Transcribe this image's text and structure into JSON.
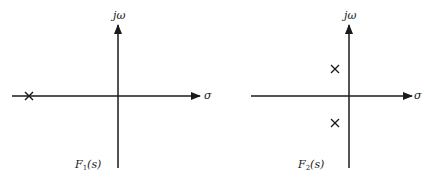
{
  "diagram": {
    "type": "s-plane pole plots",
    "panels": [
      {
        "name": "F1",
        "caption": "F",
        "caption_sub": "1",
        "caption_arg": "(s)",
        "vertical_axis_label": "jω",
        "horizontal_axis_label": "σ",
        "poles": [
          {
            "description": "single real pole on negative real axis"
          }
        ]
      },
      {
        "name": "F2",
        "caption": "F",
        "caption_sub": "2",
        "caption_arg": "(s)",
        "vertical_axis_label": "jω",
        "horizontal_axis_label": "σ",
        "poles": [
          {
            "description": "complex pole, upper half-plane, slightly left of imaginary axis"
          },
          {
            "description": "complex conjugate pole, lower half-plane, slightly left of imaginary axis"
          }
        ]
      }
    ],
    "colors": {
      "ink": "#1a1a1a",
      "background": "#ffffff"
    }
  }
}
